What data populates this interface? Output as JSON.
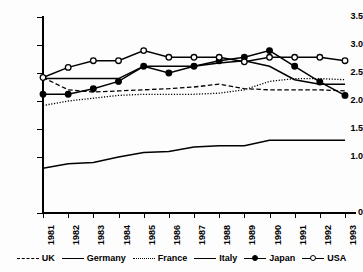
{
  "chart_data": {
    "type": "line",
    "title": "",
    "xlabel": "",
    "ylabel": "",
    "grid": false,
    "legend_position": "bottom",
    "x": [
      "1981",
      "1982",
      "1983",
      "1984",
      "1985",
      "1986",
      "1987",
      "1988",
      "1989",
      "1990",
      "1991",
      "1992",
      "1993"
    ],
    "ylim": [
      0,
      3.5
    ],
    "yticks": [
      "0",
      "1.0",
      "1.5",
      "2.0",
      "2.5",
      "3.0",
      "3.5"
    ],
    "ytick_values": [
      0,
      1.0,
      1.5,
      2.0,
      2.5,
      3.0,
      3.5
    ],
    "series": [
      {
        "name": "UK",
        "style": "dashed",
        "marker": "none",
        "values": [
          2.42,
          2.2,
          2.16,
          2.18,
          2.2,
          2.22,
          2.25,
          2.3,
          2.22,
          2.2,
          2.2,
          2.2,
          2.18
        ]
      },
      {
        "name": "Germany",
        "style": "solid",
        "marker": "none",
        "values": [
          2.4,
          2.4,
          2.4,
          2.4,
          2.62,
          2.62,
          2.62,
          2.68,
          2.72,
          2.62,
          2.38,
          2.3,
          2.3
        ]
      },
      {
        "name": "France",
        "style": "dotted",
        "marker": "none",
        "values": [
          1.92,
          2.0,
          2.05,
          2.1,
          2.12,
          2.12,
          2.12,
          2.14,
          2.2,
          2.35,
          2.4,
          2.4,
          2.38
        ]
      },
      {
        "name": "Italy",
        "style": "solid",
        "marker": "none",
        "values": [
          0.8,
          0.88,
          0.9,
          1.0,
          1.08,
          1.1,
          1.18,
          1.2,
          1.2,
          1.3,
          1.3,
          1.3,
          1.3
        ]
      },
      {
        "name": "Japan",
        "style": "solid",
        "marker": "filled",
        "values": [
          2.12,
          2.12,
          2.22,
          2.35,
          2.62,
          2.5,
          2.62,
          2.72,
          2.78,
          2.9,
          2.62,
          2.34,
          2.1
        ]
      },
      {
        "name": "USA",
        "style": "solid",
        "marker": "open",
        "values": [
          2.42,
          2.6,
          2.72,
          2.72,
          2.9,
          2.78,
          2.78,
          2.78,
          2.7,
          2.78,
          2.78,
          2.78,
          2.72
        ]
      }
    ]
  },
  "legend": {
    "items": [
      {
        "label": "UK",
        "style": "dashed",
        "marker": "none"
      },
      {
        "label": "Germany",
        "style": "solid",
        "marker": "none"
      },
      {
        "label": "France",
        "style": "dotted",
        "marker": "none"
      },
      {
        "label": "Italy",
        "style": "solid",
        "marker": "none"
      },
      {
        "label": "Japan",
        "style": "solid",
        "marker": "filled"
      },
      {
        "label": "USA",
        "style": "solid",
        "marker": "open"
      }
    ]
  },
  "colors": {
    "ink": "#000000",
    "background": "#fdfdfd"
  }
}
